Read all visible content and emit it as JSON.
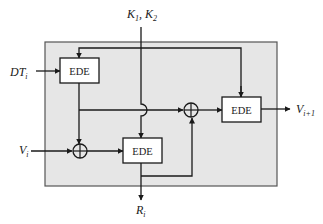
{
  "diagram": {
    "colors": {
      "panel_fill": "#e6e6e6",
      "panel_border": "#555555",
      "line": "#1a1a1a",
      "box_fill": "#ffffff"
    },
    "blocks": [
      {
        "id": "ede1",
        "label": "EDE"
      },
      {
        "id": "ede2",
        "label": "EDE"
      },
      {
        "id": "ede3",
        "label": "EDE"
      }
    ],
    "xor_nodes": [
      {
        "id": "xor1",
        "symbol": "⊕"
      },
      {
        "id": "xor2",
        "symbol": "⊕"
      }
    ],
    "inputs": {
      "keys": {
        "k1_base": "K",
        "k1_sub": "1",
        "sep": ", ",
        "k2_base": "K",
        "k2_sub": "2"
      },
      "dt": {
        "base": "DT",
        "sub": "i"
      },
      "v": {
        "base": "V",
        "sub": "i"
      }
    },
    "outputs": {
      "v_next": {
        "base": "V",
        "sub": "i+1"
      },
      "r": {
        "base": "R",
        "sub": "i"
      }
    }
  }
}
